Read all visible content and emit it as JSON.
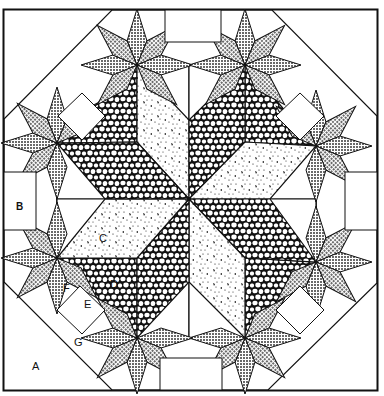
{
  "diagram": {
    "type": "quilt-block-pattern",
    "colors": {
      "background": "#ffffff",
      "line": "#111111",
      "small_star_fill": "#b8b8b8",
      "stone_fill": "#1a1a1a",
      "speckle_fill": "#f4f4f4"
    },
    "labels": [
      {
        "id": "A",
        "text": "A",
        "x": 32,
        "y": 370
      },
      {
        "id": "B",
        "text": "B",
        "x": 20,
        "y": 210
      },
      {
        "id": "C",
        "text": "C",
        "x": 103,
        "y": 241
      },
      {
        "id": "D",
        "text": "D",
        "x": 115,
        "y": 286
      },
      {
        "id": "E",
        "text": "E",
        "x": 88,
        "y": 305
      },
      {
        "id": "F",
        "text": "F",
        "x": 66,
        "y": 289
      },
      {
        "id": "G",
        "text": "G",
        "x": 78,
        "y": 344
      }
    ]
  }
}
